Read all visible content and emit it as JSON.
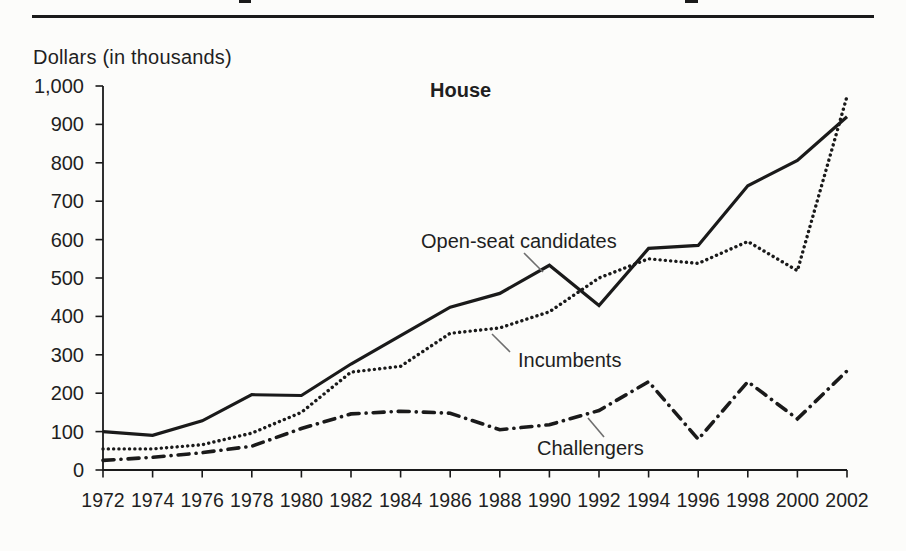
{
  "figure": {
    "ylabel_heading": "Dollars (in thousands)"
  },
  "chart_data": {
    "type": "line",
    "title": "House",
    "ylabel": "Dollars (in thousands)",
    "xlabel": "",
    "grid": false,
    "legend_position": "inline-labels-with-leader-lines",
    "ylim": [
      0,
      1000
    ],
    "y_tick_values": [
      0,
      100,
      200,
      300,
      400,
      500,
      600,
      700,
      800,
      900,
      1000
    ],
    "y_tick_labels": [
      "0",
      "100",
      "200",
      "300",
      "400",
      "500",
      "600",
      "700",
      "800",
      "900",
      "1,000"
    ],
    "x": [
      1972,
      1974,
      1976,
      1978,
      1980,
      1982,
      1984,
      1986,
      1988,
      1990,
      1992,
      1994,
      1996,
      1998,
      2000,
      2002
    ],
    "x_tick_labels": [
      "1972",
      "1974",
      "1976",
      "1978",
      "1980",
      "1982",
      "1984",
      "1986",
      "1988",
      "1990",
      "1992",
      "1994",
      "1996",
      "1998",
      "2000",
      "2002"
    ],
    "series": [
      {
        "name": "Open-seat candidates",
        "line_style": "solid",
        "values": [
          100,
          90,
          128,
          196,
          194,
          276,
          350,
          424,
          460,
          533,
          428,
          577,
          585,
          740,
          806,
          920
        ]
      },
      {
        "name": "Incumbents",
        "line_style": "dotted",
        "values": [
          55,
          55,
          66,
          96,
          150,
          255,
          270,
          356,
          370,
          412,
          500,
          550,
          538,
          595,
          519,
          973
        ]
      },
      {
        "name": "Challengers",
        "line_style": "dash-dot",
        "values": [
          25,
          33,
          45,
          62,
          108,
          146,
          153,
          148,
          105,
          118,
          155,
          230,
          80,
          230,
          133,
          258
        ]
      }
    ],
    "line_color": "#1a1a1a"
  }
}
